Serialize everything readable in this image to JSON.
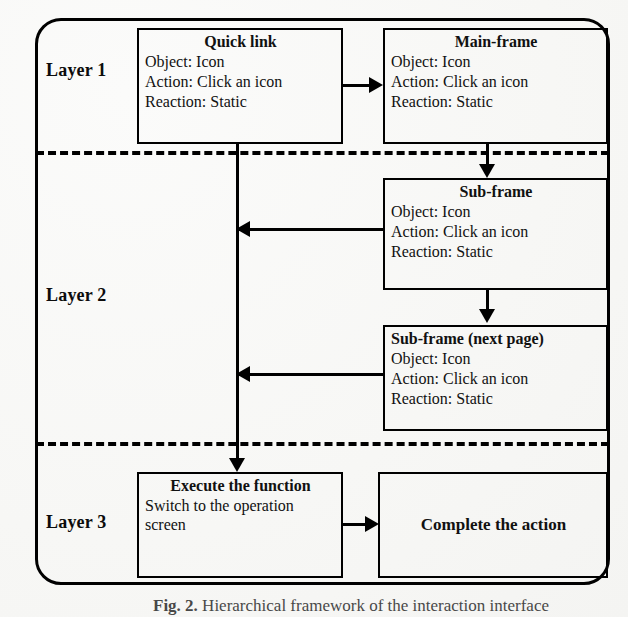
{
  "figure": {
    "caption_label": "Fig. 2.",
    "caption_text": "Hierarchical framework of the interaction interface"
  },
  "layers": [
    {
      "id": "layer-1",
      "label": "Layer 1"
    },
    {
      "id": "layer-2",
      "label": "Layer 2"
    },
    {
      "id": "layer-3",
      "label": "Layer 3"
    }
  ],
  "nodes": {
    "quick_link": {
      "title": "Quick link",
      "object": "Object: Icon",
      "action": "Action: Click an icon",
      "reaction": "Reaction: Static"
    },
    "main_frame": {
      "title": "Main-frame",
      "object": "Object: Icon",
      "action": "Action: Click an icon",
      "reaction": "Reaction: Static"
    },
    "sub_frame": {
      "title": "Sub-frame",
      "object": "Object: Icon",
      "action": "Action: Click an icon",
      "reaction": "Reaction: Static"
    },
    "sub_frame_next": {
      "title": "Sub-frame (next page)",
      "object": "Object: Icon",
      "action": "Action: Click an icon",
      "reaction": "Reaction: Static"
    },
    "execute": {
      "title": "Execute the function",
      "detail": "Switch to the operation screen"
    },
    "complete": {
      "title": "Complete the action"
    }
  },
  "connectors": [
    {
      "id": "quick-link-to-main-frame",
      "from": "quick_link",
      "to": "main_frame",
      "direction": "right"
    },
    {
      "id": "main-frame-to-sub-frame",
      "from": "main_frame",
      "to": "sub_frame",
      "direction": "down"
    },
    {
      "id": "sub-frame-to-spine",
      "from": "sub_frame",
      "to": "spine",
      "direction": "left"
    },
    {
      "id": "sub-frame-to-sub-frame-next",
      "from": "sub_frame",
      "to": "sub_frame_next",
      "direction": "down"
    },
    {
      "id": "sub-frame-next-to-spine",
      "from": "sub_frame_next",
      "to": "spine",
      "direction": "left"
    },
    {
      "id": "spine-to-execute",
      "from": "quick_link",
      "to": "execute",
      "direction": "down"
    },
    {
      "id": "execute-to-complete",
      "from": "execute",
      "to": "complete",
      "direction": "right"
    }
  ],
  "colors": {
    "stroke": "#000000",
    "text": "#111111",
    "background": "#f7f7f5"
  }
}
